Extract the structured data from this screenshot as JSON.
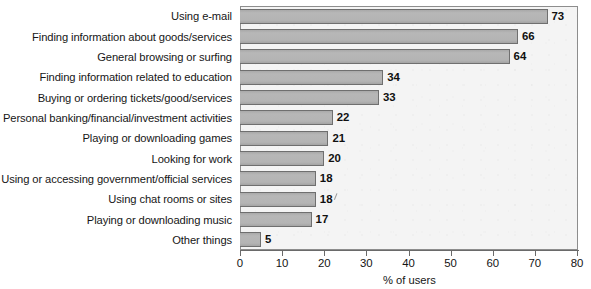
{
  "chart_data": {
    "type": "bar",
    "orientation": "horizontal",
    "title": "",
    "xlabel": "% of users",
    "ylabel": "",
    "xlim": [
      0,
      80
    ],
    "xticks": [
      0,
      10,
      20,
      30,
      40,
      50,
      60,
      70,
      80
    ],
    "xtick_labels": [
      "0",
      "10",
      "20",
      "30",
      "40",
      "50",
      "60",
      "70",
      "80"
    ],
    "grid": false,
    "legend": false,
    "bar_color": "#b4b4b4",
    "bar_edge_color": "#6f6f6f",
    "plot_background": "#f4f4f4",
    "categories": [
      "Using e-mail",
      "Finding information about goods/services",
      "General browsing or surfing",
      "Finding information related to education",
      "Buying or ordering tickets/good/services",
      "Personal banking/financial/investment activities",
      "Playing or downloading games",
      "Looking for work",
      "Using or accessing government/official services",
      "Using chat rooms or sites",
      "Playing or downloading music",
      "Other things"
    ],
    "values": [
      73,
      66,
      64,
      34,
      33,
      22,
      21,
      20,
      18,
      18,
      17,
      5
    ],
    "data_labels": [
      "73",
      "66",
      "64",
      "34",
      "33",
      "22",
      "21",
      "20",
      "18",
      "18",
      "17",
      "5"
    ]
  }
}
